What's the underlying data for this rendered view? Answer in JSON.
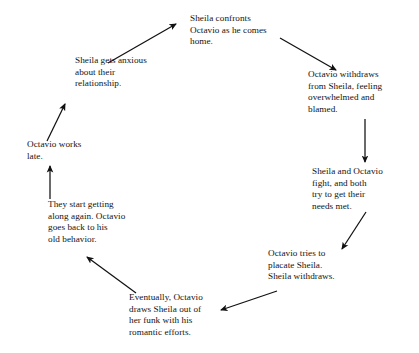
{
  "diagram": {
    "type": "cycle-flow-diagram",
    "background_color": "#ffffff",
    "text_color": "#131313",
    "arrow_color": "#111111",
    "nodes": [
      {
        "id": "sheila-confronts",
        "text": "Sheila confronts\nOctavio as he comes\nhome."
      },
      {
        "id": "octavio-withdraws",
        "text": "Octavio withdraws\nfrom Sheila, feeling\noverwhelmed and\nblamed."
      },
      {
        "id": "sheila-and-octavio-fight",
        "text": "Sheila and Octavio\nfight, and both\ntry to get their\nneeds met."
      },
      {
        "id": "octavio-placates",
        "text": "Octavio tries to\nplacate Sheila.\nSheila withdraws."
      },
      {
        "id": "eventually-octavio-draws-sheila-out",
        "text": "Eventually, Octavio\ndraws Sheila out of\nher funk with his\nromantic efforts."
      },
      {
        "id": "they-start-getting-along",
        "text": "They start getting\nalong again. Octavio\ngoes back to his\nold behavior."
      },
      {
        "id": "octavio-works-late",
        "text": "Octavio works\nlate."
      },
      {
        "id": "sheila-gets-anxious",
        "text": "Sheila gets anxious\nabout their\nrelationship."
      }
    ],
    "edges": [
      {
        "id": "edge-confronts-to-withdraws",
        "from": "sheila-confronts",
        "to": "octavio-withdraws",
        "shape": "diagonal-down-right"
      },
      {
        "id": "edge-withdraws-to-fight",
        "from": "octavio-withdraws",
        "to": "sheila-and-octavio-fight",
        "shape": "vertical-down"
      },
      {
        "id": "edge-fight-to-placate",
        "from": "sheila-and-octavio-fight",
        "to": "octavio-placates",
        "shape": "diagonal-down-left"
      },
      {
        "id": "edge-placate-to-eventually",
        "from": "octavio-placates",
        "to": "eventually-octavio-draws-sheila-out",
        "shape": "diagonal-down-left"
      },
      {
        "id": "edge-eventually-to-along",
        "from": "eventually-octavio-draws-sheila-out",
        "to": "they-start-getting-along",
        "shape": "diagonal-up-left"
      },
      {
        "id": "edge-along-to-works-late",
        "from": "they-start-getting-along",
        "to": "octavio-works-late",
        "shape": "vertical-up"
      },
      {
        "id": "edge-works-late-to-anxious",
        "from": "octavio-works-late",
        "to": "sheila-gets-anxious",
        "shape": "diagonal-up-right"
      },
      {
        "id": "edge-anxious-to-confronts",
        "from": "sheila-gets-anxious",
        "to": "sheila-confronts",
        "shape": "diagonal-up-right"
      }
    ]
  }
}
